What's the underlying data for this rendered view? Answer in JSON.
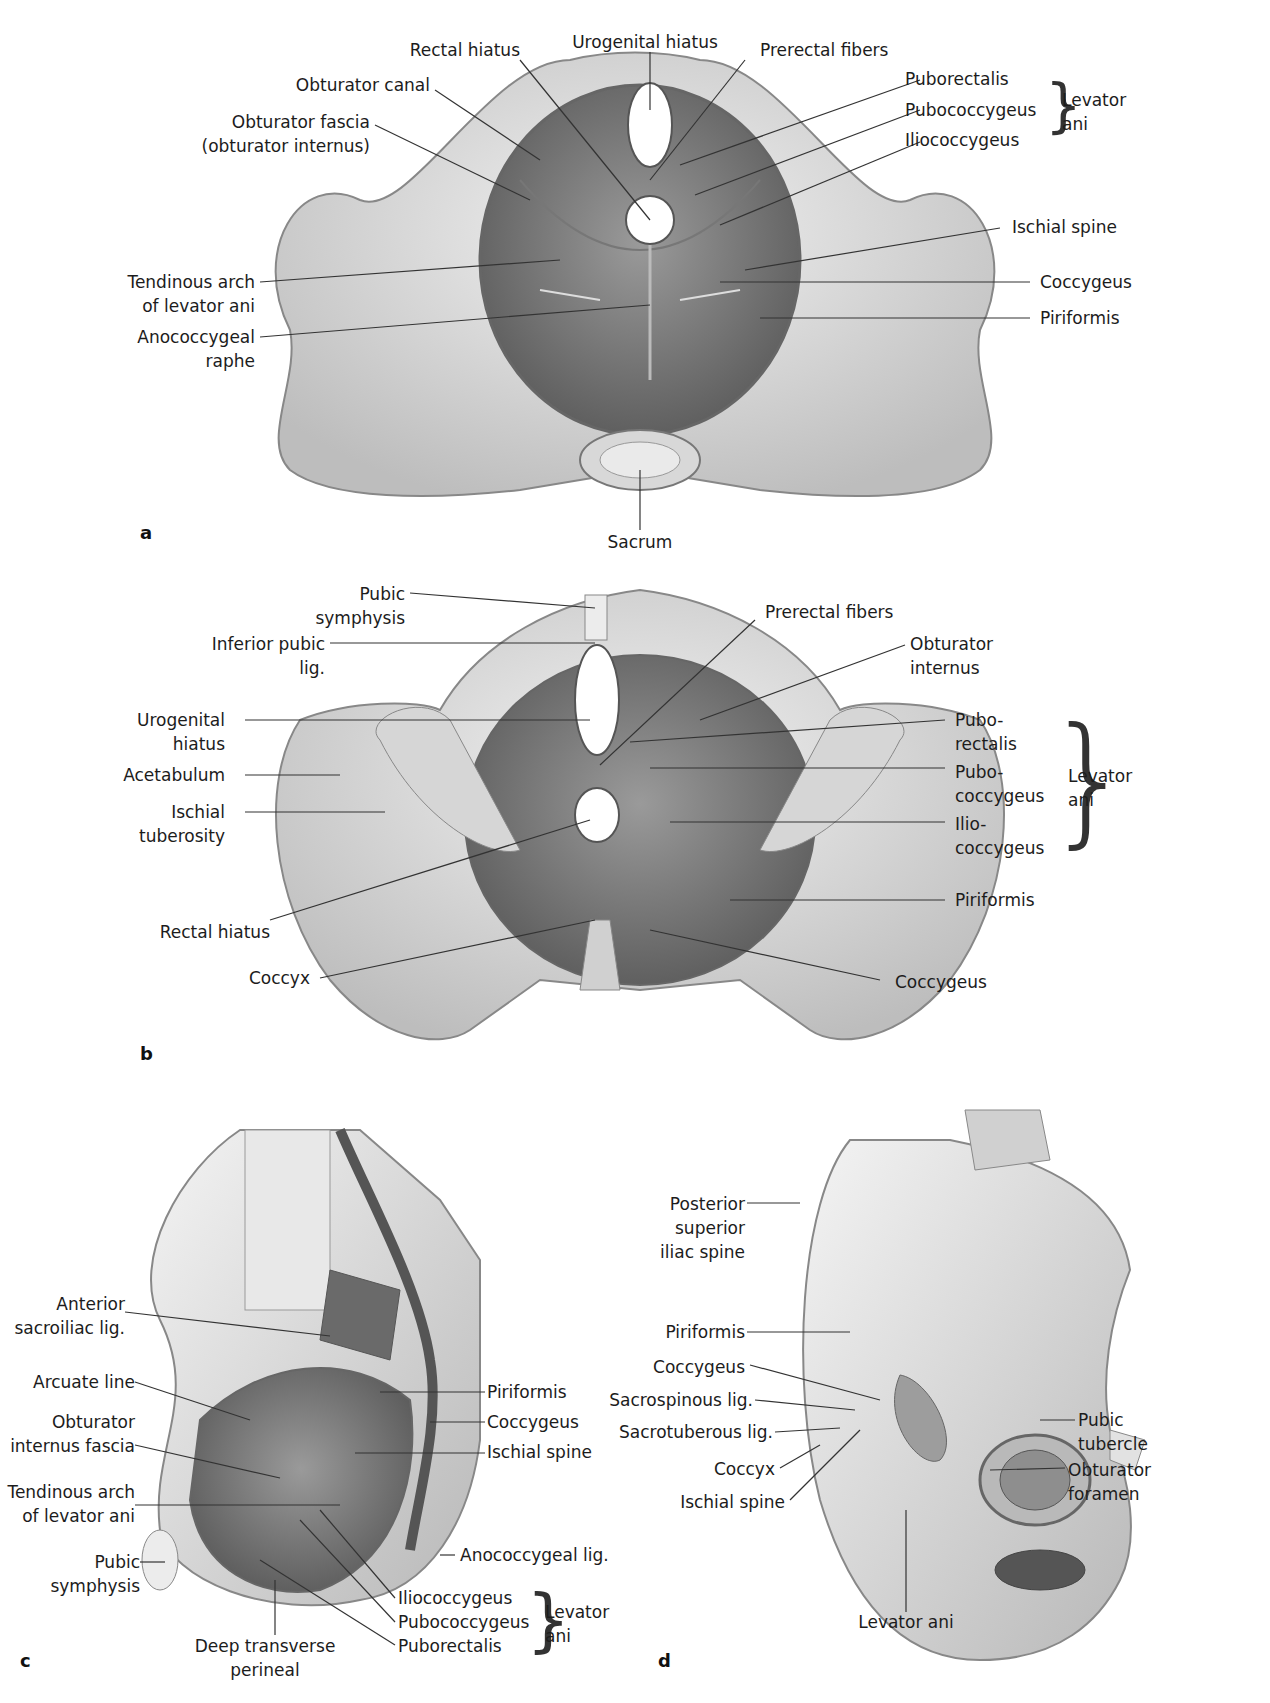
{
  "panels": [
    {
      "letter": "a",
      "labels": {
        "rectal_hiatus": "Rectal hiatus",
        "urogenital_hiatus": "Urogenital hiatus",
        "prerectal_fibers": "Prerectal fibers",
        "obturator_canal": "Obturator canal",
        "obturator_fascia": "Obturator fascia\n(obturator internus)",
        "puborectalis": "Puborectalis",
        "pubococcygeus": "Pubococcygeus",
        "iliococcygeus": "Iliococcygeus",
        "levator_ani": "Levator\nani",
        "ischial_spine": "Ischial spine",
        "tendinous_arch": "Tendinous arch\nof levator ani",
        "coccygeus": "Coccygeus",
        "anococcygeal_raphe": "Anococcygeal\nraphe",
        "piriformis": "Piriformis",
        "sacrum": "Sacrum"
      }
    },
    {
      "letter": "b",
      "labels": {
        "pubic_symphysis": "Pubic\nsymphysis",
        "inferior_pubic_lig": "Inferior pubic\nlig.",
        "prerectal_fibers": "Prerectal fibers",
        "obturator_internus": "Obturator\ninternus",
        "urogenital_hiatus": "Urogenital\nhiatus",
        "acetabulum": "Acetabulum",
        "ischial_tuberosity": "Ischial\ntuberosity",
        "puborectalis": "Pubo-\nrectalis",
        "pubococcygeus": "Pubo-\ncoccygeus",
        "iliococcygeus": "Ilio-\ncoccygeus",
        "levator_ani": "Levator\nani",
        "piriformis": "Piriformis",
        "rectal_hiatus": "Rectal hiatus",
        "coccyx": "Coccyx",
        "coccygeus": "Coccygeus"
      }
    },
    {
      "letter": "c",
      "labels": {
        "anterior_sacroiliac_lig": "Anterior\nsacroiliac lig.",
        "arcuate_line": "Arcuate line",
        "obturator_internus_fascia": "Obturator\ninternus fascia",
        "tendinous_arch": "Tendinous arch\nof levator ani",
        "pubic_symphysis": "Pubic symphysis",
        "piriformis": "Piriformis",
        "coccygeus": "Coccygeus",
        "ischial_spine": "Ischial spine",
        "anococcygeal_lig": "Anococcygeal lig.",
        "iliococcygeus": "Iliococcygeus",
        "pubococcygeus": "Pubococcygeus",
        "puborectalis": "Puborectalis",
        "levator_ani": "Levator\nani",
        "deep_transverse_perineal": "Deep transverse\nperineal"
      }
    },
    {
      "letter": "d",
      "labels": {
        "posterior_superior_iliac_spine": "Posterior\nsuperior\niliac spine",
        "piriformis": "Piriformis",
        "coccygeus": "Coccygeus",
        "sacrospinous_lig": "Sacrospinous lig.",
        "sacrotuberous_lig": "Sacrotuberous lig.",
        "coccyx": "Coccyx",
        "ischial_spine": "Ischial spine",
        "pubic_tubercle": "Pubic\ntubercle",
        "obturator_foramen": "Obturator\nforamen",
        "levator_ani": "Levator ani"
      }
    }
  ],
  "colors": {
    "bone": "#e6e6e6",
    "bone_shadow": "#bdbdbd",
    "muscle": "#8a8a8a",
    "muscle_dark": "#5e5e5e",
    "leader": "#333333"
  }
}
